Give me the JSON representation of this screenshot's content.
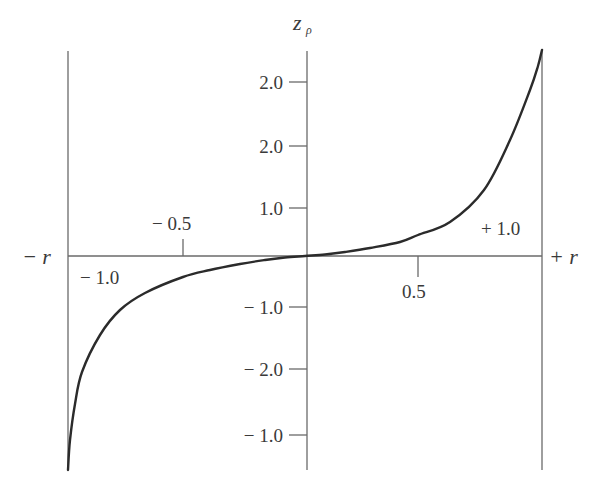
{
  "chart_data": {
    "type": "line",
    "title": "",
    "xlabel_left": "− r",
    "xlabel_right": "+ r",
    "ylabel": "z",
    "ylabel_subscript": "ρ",
    "x_range": [
      -1.0,
      1.0
    ],
    "x_tick_labels": [
      {
        "label": "− 0.5",
        "value": -0.5,
        "side": "above"
      },
      {
        "label": "0.5",
        "value": 0.5,
        "side": "below"
      }
    ],
    "corner_labels": {
      "lower_left": "− 1.0",
      "upper_right": "+ 1.0"
    },
    "y_tick_labels": [
      "2.0",
      "2.0",
      "1.0",
      "− 1.0",
      "− 2.0",
      "− 1.0"
    ],
    "grid": false,
    "legend": null,
    "series": [
      {
        "name": "z_rho (Fisher z-transform of r)",
        "description": "S-shaped curve passing through origin, asymptotic toward r = ±1",
        "x": [
          -1.0,
          -0.99,
          -0.95,
          -0.9,
          -0.8,
          -0.7,
          -0.6,
          -0.5,
          -0.4,
          -0.3,
          -0.2,
          -0.1,
          0.0,
          0.1,
          0.2,
          0.3,
          0.4,
          0.5,
          0.6,
          0.7,
          0.8,
          0.9,
          0.95,
          0.99,
          1.0
        ],
        "pixel_path": [
          [
            68,
            470
          ],
          [
            70,
            440
          ],
          [
            75,
            404
          ],
          [
            82,
            372
          ],
          [
            100,
            335
          ],
          [
            120,
            310
          ],
          [
            145,
            293
          ],
          [
            183,
            277
          ],
          [
            210,
            270
          ],
          [
            240,
            264
          ],
          [
            265,
            260
          ],
          [
            285,
            257.5
          ],
          [
            305,
            256
          ],
          [
            325,
            254.5
          ],
          [
            345,
            252
          ],
          [
            370,
            248
          ],
          [
            400,
            242
          ],
          [
            418,
            235
          ],
          [
            450,
            222
          ],
          [
            484,
            190
          ],
          [
            510,
            140
          ],
          [
            530,
            90
          ],
          [
            538,
            66
          ],
          [
            542,
            50
          ]
        ]
      }
    ]
  },
  "axes": {
    "center_x": 305,
    "baseline_y": 256,
    "left_x": 68,
    "right_x": 542,
    "top_y": 51,
    "bottom_y": 470,
    "y_ticks_px": [
      82,
      146,
      208,
      307,
      369,
      435
    ]
  },
  "colors": {
    "axis": "#6a6a6a",
    "curve": "#2b2b2b",
    "text": "#3a3a3a"
  }
}
